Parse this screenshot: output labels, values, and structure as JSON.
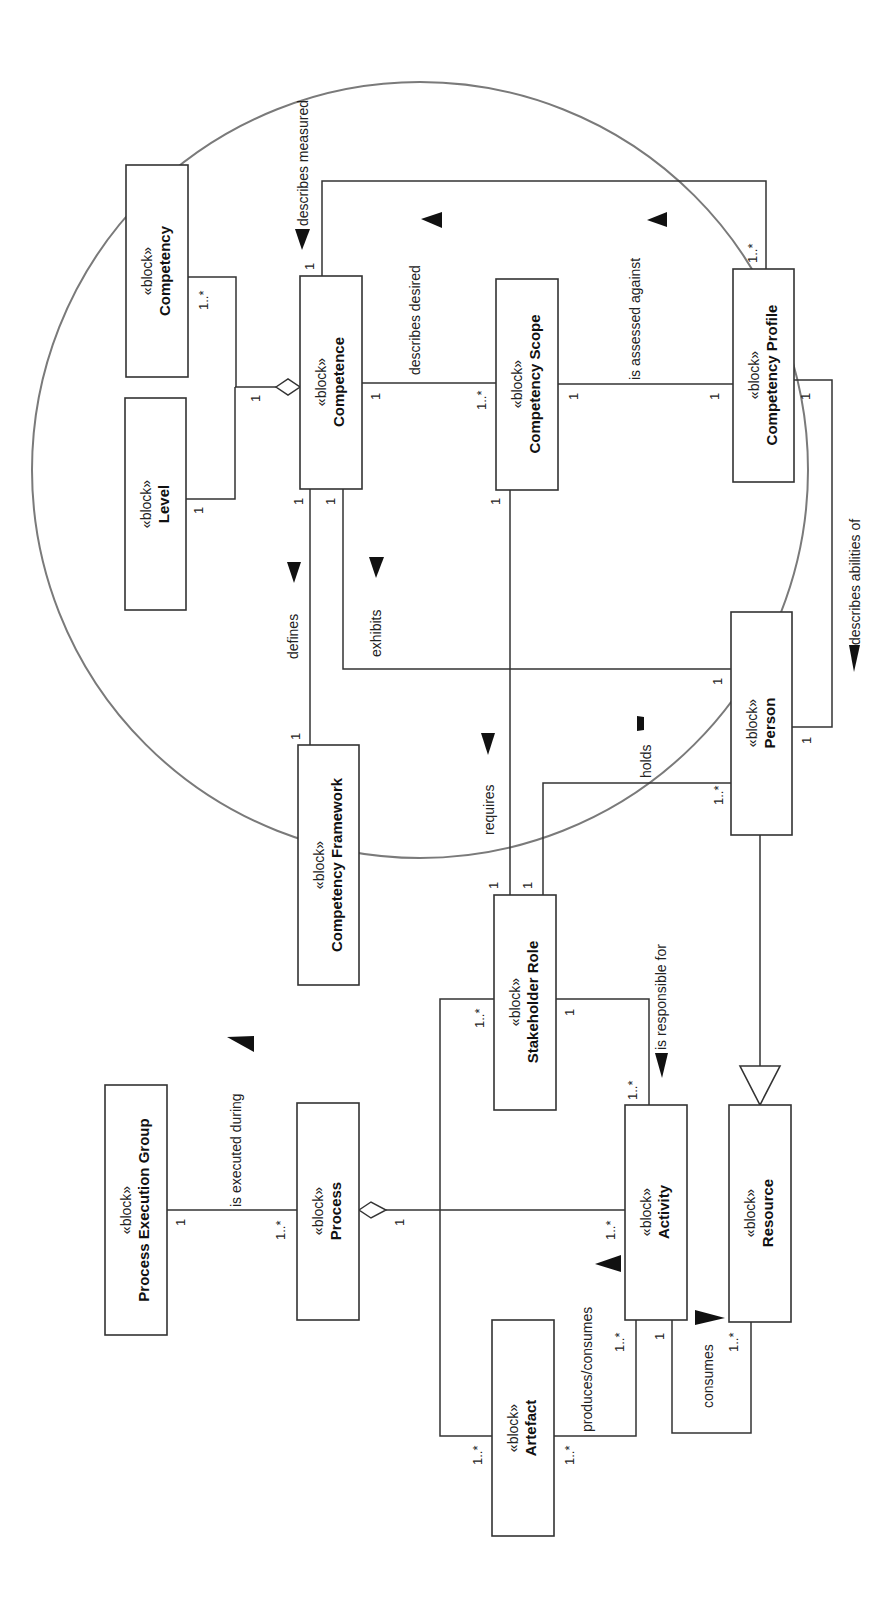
{
  "diagram": {
    "type": "SysML block definition diagram (rotated 90°)",
    "stereotype": "«block»",
    "blocks": [
      {
        "id": "competency",
        "name": "Competency"
      },
      {
        "id": "level",
        "name": "Level"
      },
      {
        "id": "competence",
        "name": "Competence"
      },
      {
        "id": "competency_scope",
        "name": "Competency Scope"
      },
      {
        "id": "competency_profile",
        "name": "Competency Profile"
      },
      {
        "id": "person",
        "name": "Person"
      },
      {
        "id": "competency_framework",
        "name": "Competency Framework"
      },
      {
        "id": "stakeholder_role",
        "name": "Stakeholder Role"
      },
      {
        "id": "process_execution_group",
        "name": "Process Execution Group"
      },
      {
        "id": "process",
        "name": "Process"
      },
      {
        "id": "activity",
        "name": "Activity"
      },
      {
        "id": "resource",
        "name": "Resource"
      },
      {
        "id": "artefact",
        "name": "Artefact"
      }
    ],
    "relationships": [
      {
        "from": "Competence",
        "to": "Competency",
        "kind": "aggregation",
        "mult_whole": "1",
        "mult_part": "1..*"
      },
      {
        "from": "Competence",
        "to": "Level",
        "kind": "aggregation",
        "mult_whole": "1",
        "mult_part": "1"
      },
      {
        "label": "describes measured",
        "from": "Competency Profile",
        "to": "Competence",
        "mult_from": "1..*",
        "mult_to": "1"
      },
      {
        "label": "describes desired",
        "from": "Competency Scope",
        "to": "Competence",
        "mult_from": "1..*",
        "mult_to": "1"
      },
      {
        "label": "is assessed against",
        "from": "Competency Profile",
        "to": "Competency Scope",
        "mult_from": "1",
        "mult_to": "1"
      },
      {
        "label": "describes abilities of",
        "from": "Competency Profile",
        "to": "Person",
        "mult_from": "1",
        "mult_to": "1"
      },
      {
        "label": "defines",
        "from": "Competency Framework",
        "to": "Competence",
        "mult_from": "1",
        "mult_to": "1"
      },
      {
        "label": "exhibits",
        "from": "Person",
        "to": "Competence",
        "mult_from": "1",
        "mult_to": "1"
      },
      {
        "label": "requires",
        "from": "Stakeholder Role",
        "to": "Competency Scope",
        "mult_from": "1",
        "mult_to": "1"
      },
      {
        "label": "holds",
        "from": "Person",
        "to": "Stakeholder Role",
        "mult_from": "1..*",
        "mult_to": "1"
      },
      {
        "label": "is responsible for",
        "from": "Stakeholder Role",
        "to": "Activity",
        "mult_from": "1",
        "mult_to": "1..*"
      },
      {
        "label": "is executed during",
        "from": "Process",
        "to": "Process Execution Group",
        "mult_from": "1..*",
        "mult_to": "1"
      },
      {
        "from": "Process",
        "to": "Activity",
        "kind": "aggregation",
        "mult_whole": "1",
        "mult_part": "1..*"
      },
      {
        "label": "produces/consumes",
        "from": "Activity",
        "to": "Artefact",
        "mult_from": "1..*",
        "mult_to": "1..*"
      },
      {
        "label": "consumes",
        "from": "Activity",
        "to": "Resource",
        "mult_from": "1",
        "mult_to": "1..*"
      },
      {
        "from": "Person",
        "to": "Resource",
        "kind": "generalization"
      },
      {
        "from": "Stakeholder Role",
        "to": "Artefact",
        "mult_from": "1..*",
        "mult_to": "1..*"
      }
    ],
    "labels": {
      "describes_measured": "describes measured",
      "describes_desired": "describes desired",
      "is_assessed_against": "is assessed against",
      "describes_abilities_of": "describes abilities of",
      "defines": "defines",
      "exhibits": "exhibits",
      "requires": "requires",
      "holds": "holds",
      "is_responsible_for": "is responsible for",
      "is_executed_during": "is executed during",
      "produces_consumes": "produces/consumes",
      "consumes": "consumes"
    },
    "multiplicities": {
      "one": "1",
      "one_many": "1..*"
    },
    "colors": {
      "line": "#333333",
      "ellipse": "#7a7a7a",
      "background": "#ffffff"
    }
  }
}
